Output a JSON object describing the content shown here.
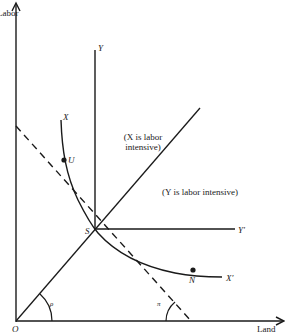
{
  "diagram": {
    "type": "isoquant-factor-intensity",
    "axes": {
      "y_label": "Labor",
      "x_label": "Land",
      "origin_label": "O"
    },
    "curves": {
      "isoquant_x_start": "X",
      "isoquant_x_end": "X′",
      "isoquant_y_start": "Y",
      "isoquant_y_end": "Y′"
    },
    "points": {
      "u": "U",
      "s": "S",
      "n": "N"
    },
    "angles": {
      "rho": "ρ",
      "pi": "π"
    },
    "regions": {
      "x_labor_intensive_line1": "(X is labor",
      "x_labor_intensive_line2": "intensive)",
      "y_labor_intensive": "(Y is labor intensive)"
    },
    "colors": {
      "ink": "#1a1a1a",
      "background": "#ffffff"
    }
  }
}
